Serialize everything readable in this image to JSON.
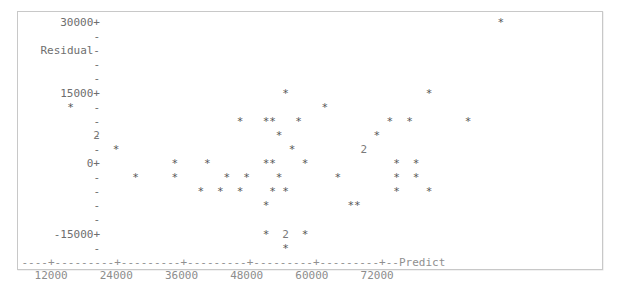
{
  "figure": {
    "kind": "minitab-ascii-residual-plot",
    "frame_border_color": "#c8c8c8",
    "background_color": "#ffffff",
    "text_color": "#6a6a6a",
    "marker_glyph": "*",
    "overlap_glyph": "2"
  },
  "axes": {
    "y_title": "Residual",
    "x_title": "Predict",
    "y_labels": [
      "30000+",
      "-",
      "Residual-",
      "-",
      "-",
      "15000+",
      "-",
      "-",
      "-",
      "-",
      "0+",
      "-",
      "-",
      "-",
      "-",
      "-15000+",
      "-"
    ],
    "x_axis_line": "----+---------+---------+---------+---------+---------+--Predict",
    "x_tick_labels": [
      "12000",
      "24000",
      "36000",
      "48000",
      "60000",
      "72000"
    ],
    "x_tick_values": [
      12000,
      24000,
      36000,
      48000,
      60000,
      72000
    ],
    "y_tick_values": [
      30000,
      15000,
      0,
      -15000
    ],
    "y_major_glyph": "+",
    "y_minor_glyph": "-"
  },
  "chart_data": {
    "type": "scatter",
    "title": "",
    "xlabel": "Predict",
    "ylabel": "Residual",
    "xlim": [
      7000,
      79000
    ],
    "ylim": [
      -21000,
      32000
    ],
    "grid": false,
    "legend": "none",
    "points": [
      {
        "x": 15000,
        "y": 13500,
        "glyph": "*",
        "count": 1
      },
      {
        "x": 18000,
        "y": 7000,
        "glyph": "2",
        "count": 2
      },
      {
        "x": 19500,
        "y": 4500,
        "glyph": "*",
        "count": 1
      },
      {
        "x": 22000,
        "y": -2500,
        "glyph": "*",
        "count": 1
      },
      {
        "x": 29500,
        "y": 1500,
        "glyph": "*",
        "count": 1
      },
      {
        "x": 30500,
        "y": -2500,
        "glyph": "*",
        "count": 1
      },
      {
        "x": 34000,
        "y": 4500,
        "glyph": "*",
        "count": 1
      },
      {
        "x": 37500,
        "y": 4500,
        "glyph": "*",
        "count": 1
      },
      {
        "x": 37500,
        "y": -1000,
        "glyph": "*",
        "count": 1
      },
      {
        "x": 38500,
        "y": -4000,
        "glyph": "*",
        "count": 1
      },
      {
        "x": 41000,
        "y": -4000,
        "glyph": "*",
        "count": 1
      },
      {
        "x": 43000,
        "y": -4000,
        "glyph": "*",
        "count": 1
      },
      {
        "x": 44500,
        "y": -2500,
        "glyph": "*",
        "count": 1
      },
      {
        "x": 47500,
        "y": 10000,
        "glyph": "*",
        "count": 1
      },
      {
        "x": 50500,
        "y": 4500,
        "glyph": "*",
        "count": 1
      },
      {
        "x": 51500,
        "y": 1500,
        "glyph": "*",
        "count": 1
      },
      {
        "x": 52500,
        "y": 1500,
        "glyph": "*",
        "count": 1
      },
      {
        "x": 51500,
        "y": 10000,
        "glyph": "*",
        "count": 1
      },
      {
        "x": 52500,
        "y": 10000,
        "glyph": "*",
        "count": 1
      },
      {
        "x": 54500,
        "y": 10000,
        "glyph": "*",
        "count": 1
      },
      {
        "x": 51000,
        "y": -2500,
        "glyph": "*",
        "count": 1
      },
      {
        "x": 51500,
        "y": -4000,
        "glyph": "*",
        "count": 1
      },
      {
        "x": 51000,
        "y": -7000,
        "glyph": "*",
        "count": 1
      },
      {
        "x": 51000,
        "y": -11500,
        "glyph": "*",
        "count": 1
      },
      {
        "x": 53500,
        "y": -11500,
        "glyph": "2",
        "count": 2
      },
      {
        "x": 55500,
        "y": -11500,
        "glyph": "*",
        "count": 1
      },
      {
        "x": 53500,
        "y": -17000,
        "glyph": "*",
        "count": 1
      },
      {
        "x": 55500,
        "y": 1500,
        "glyph": "*",
        "count": 1
      },
      {
        "x": 56500,
        "y": 21000,
        "glyph": "*",
        "count": 1
      },
      {
        "x": 58000,
        "y": 16500,
        "glyph": "*",
        "count": 1
      },
      {
        "x": 58500,
        "y": 7000,
        "glyph": "*",
        "count": 1
      },
      {
        "x": 59500,
        "y": 6000,
        "glyph": "2",
        "count": 2
      },
      {
        "x": 60500,
        "y": -5500,
        "glyph": "*",
        "count": 1
      },
      {
        "x": 61500,
        "y": -5500,
        "glyph": "*",
        "count": 1
      },
      {
        "x": 62500,
        "y": 13500,
        "glyph": "*",
        "count": 1
      },
      {
        "x": 64000,
        "y": 13500,
        "glyph": "*",
        "count": 1
      },
      {
        "x": 63500,
        "y": 1500,
        "glyph": "*",
        "count": 1
      },
      {
        "x": 65500,
        "y": 1500,
        "glyph": "*",
        "count": 1
      },
      {
        "x": 63500,
        "y": -1000,
        "glyph": "*",
        "count": 1
      },
      {
        "x": 65500,
        "y": -1000,
        "glyph": "*",
        "count": 1
      },
      {
        "x": 63500,
        "y": -4000,
        "glyph": "*",
        "count": 1
      },
      {
        "x": 66500,
        "y": -4000,
        "glyph": "*",
        "count": 1
      },
      {
        "x": 64500,
        "y": -7500,
        "glyph": "*",
        "count": 1
      },
      {
        "x": 68500,
        "y": 29500,
        "glyph": "*",
        "count": 1
      },
      {
        "x": 71500,
        "y": 10000,
        "glyph": "*",
        "count": 1
      }
    ]
  },
  "grid_rows": [
    {
      "label": "30000+",
      "cells": [
        {
          "col": 73,
          "glyph": "*"
        }
      ]
    },
    {
      "label": "-",
      "cells": []
    },
    {
      "label": "Residual-",
      "cells": []
    },
    {
      "label": "-",
      "cells": []
    },
    {
      "label": "-",
      "cells": []
    },
    {
      "label": "15000+",
      "cells": [
        {
          "col": 40,
          "glyph": "*"
        },
        {
          "col": 62,
          "glyph": "*"
        }
      ]
    },
    {
      "label": "-",
      "cells": [
        {
          "col": 7,
          "glyph": "*"
        },
        {
          "col": 46,
          "glyph": "*"
        }
      ]
    },
    {
      "label": "-",
      "cells": [
        {
          "col": 33,
          "glyph": "*"
        },
        {
          "col": 37,
          "glyph": "*"
        },
        {
          "col": 38,
          "glyph": "*"
        },
        {
          "col": 42,
          "glyph": "*"
        },
        {
          "col": 56,
          "glyph": "*"
        },
        {
          "col": 59,
          "glyph": "*"
        },
        {
          "col": 68,
          "glyph": "*"
        }
      ]
    },
    {
      "label": "-",
      "cells": [
        {
          "col": 11,
          "digit": "2"
        },
        {
          "col": 39,
          "glyph": "*"
        },
        {
          "col": 54,
          "glyph": "*"
        }
      ]
    },
    {
      "label": "-",
      "cells": [
        {
          "col": 14,
          "glyph": "*"
        },
        {
          "col": 41,
          "glyph": "*"
        },
        {
          "col": 52,
          "digit": "2"
        }
      ]
    },
    {
      "label": "0+",
      "cells": [
        {
          "col": 23,
          "glyph": "*"
        },
        {
          "col": 28,
          "glyph": "*"
        },
        {
          "col": 37,
          "glyph": "*"
        },
        {
          "col": 38,
          "glyph": "*"
        },
        {
          "col": 43,
          "glyph": "*"
        },
        {
          "col": 57,
          "glyph": "*"
        },
        {
          "col": 60,
          "glyph": "*"
        }
      ]
    },
    {
      "label": "-",
      "cells": [
        {
          "col": 17,
          "glyph": "*"
        },
        {
          "col": 23,
          "glyph": "*"
        },
        {
          "col": 31,
          "glyph": "*"
        },
        {
          "col": 34,
          "glyph": "*"
        },
        {
          "col": 39,
          "glyph": "*"
        },
        {
          "col": 48,
          "glyph": "*"
        },
        {
          "col": 57,
          "glyph": "*"
        },
        {
          "col": 60,
          "glyph": "*"
        }
      ]
    },
    {
      "label": "-",
      "cells": [
        {
          "col": 27,
          "glyph": "*"
        },
        {
          "col": 30,
          "glyph": "*"
        },
        {
          "col": 33,
          "glyph": "*"
        },
        {
          "col": 38,
          "glyph": "*"
        },
        {
          "col": 40,
          "glyph": "*"
        },
        {
          "col": 57,
          "glyph": "*"
        },
        {
          "col": 62,
          "glyph": "*"
        }
      ]
    },
    {
      "label": "-",
      "cells": [
        {
          "col": 37,
          "glyph": "*"
        },
        {
          "col": 50,
          "glyph": "*"
        },
        {
          "col": 51,
          "glyph": "*"
        }
      ]
    },
    {
      "label": "-",
      "cells": []
    },
    {
      "label": "-15000+",
      "cells": [
        {
          "col": 37,
          "glyph": "*"
        },
        {
          "col": 40,
          "digit": "2"
        },
        {
          "col": 43,
          "glyph": "*"
        }
      ]
    },
    {
      "label": "-",
      "cells": [
        {
          "col": 40,
          "glyph": "*"
        }
      ]
    }
  ]
}
